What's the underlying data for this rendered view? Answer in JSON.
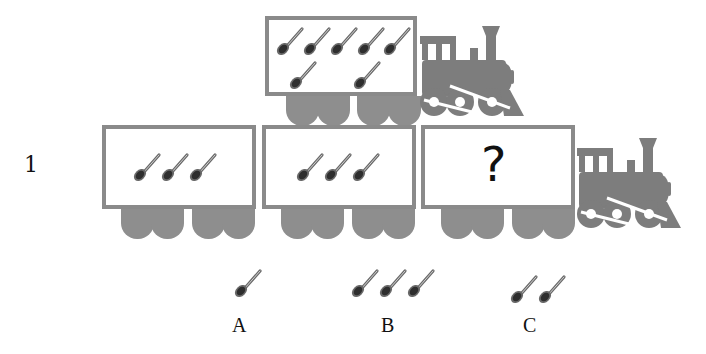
{
  "problem": {
    "number": "1",
    "question_mark": "?"
  },
  "top_train": {
    "car": {
      "spoon_count": 7,
      "rows": [
        5,
        2
      ]
    }
  },
  "bottom_train": {
    "cars": [
      {
        "spoon_count": 3
      },
      {
        "spoon_count": 3
      },
      {
        "spoon_count": null,
        "label": "?"
      }
    ]
  },
  "options": [
    {
      "label": "A",
      "spoon_count": 1
    },
    {
      "label": "B",
      "spoon_count": 3
    },
    {
      "label": "C",
      "spoon_count": 2
    }
  ],
  "icons": {
    "spoon": "spoon-icon",
    "locomotive": "locomotive-icon"
  },
  "colors": {
    "car_border": "#8a8a8a",
    "wheel": "#8e8e8e",
    "locomotive": "#7d7d7d",
    "spoon_bowl": "#333333",
    "spoon_handle": "#6a6a6a"
  }
}
